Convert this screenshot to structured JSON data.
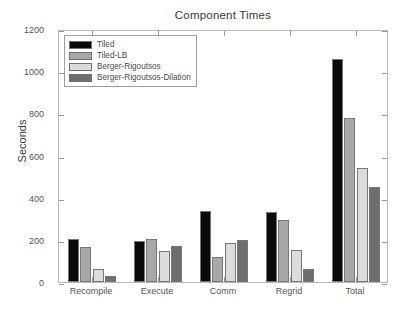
{
  "chart_data": {
    "type": "bar",
    "title": "Component Times",
    "xlabel": "",
    "ylabel": "Seconds",
    "categories": [
      "Recompile",
      "Execute",
      "Comm",
      "Regrid",
      "Total"
    ],
    "ylim": [
      0,
      1200
    ],
    "yticks": [
      0,
      200,
      400,
      600,
      800,
      1000,
      1200
    ],
    "ytick_labels": [
      "0",
      "200",
      "400",
      "600",
      "800",
      "1000",
      "1200"
    ],
    "grid": false,
    "legend_position": "upper left",
    "series": [
      {
        "name": "Tiled",
        "color": "#0a0a0a",
        "values": [
          205,
          195,
          338,
          332,
          1060
        ]
      },
      {
        "name": "Tiled-LB",
        "color": "#a8a8a8",
        "values": [
          165,
          205,
          120,
          296,
          778
        ]
      },
      {
        "name": "Berger-Rigoutsos",
        "color": "#dcdcdc",
        "values": [
          62,
          148,
          185,
          150,
          540
        ]
      },
      {
        "name": "Berger-Rigoutsos-Dilation",
        "color": "#6e6e6e",
        "values": [
          27,
          172,
          200,
          62,
          452
        ]
      }
    ]
  },
  "figure": {
    "background": "#ffffff",
    "axis_color": "#b9b9b9",
    "text_color": "#3a3a3a"
  }
}
